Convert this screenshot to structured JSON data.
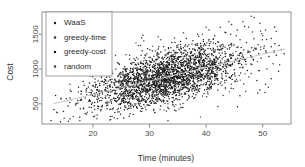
{
  "chart_data": {
    "type": "scatter",
    "title": "",
    "xlabel": "Time (minutes)",
    "ylabel": "Cost",
    "xlim": [
      11,
      55
    ],
    "ylim": [
      210,
      1820
    ],
    "xticks": [
      20,
      30,
      40,
      50
    ],
    "yticks": [
      500,
      1000,
      1500
    ],
    "xtick_labels": [
      "20",
      "30",
      "40",
      "50"
    ],
    "ytick_labels": [
      "500",
      "1000",
      "1500"
    ],
    "grid": false,
    "legend_position": "top-left",
    "marker": "point",
    "marker_color": "#1a1a1a",
    "trend_line": {
      "present": true,
      "color": "#c9c9c9",
      "x_start": 13.0,
      "y_start": 500,
      "x_end": 54.0,
      "y_end": 1290
    },
    "series": [
      {
        "name": "WaaS",
        "color": "#1a1a1a",
        "marker": "point",
        "points": [
          [
            12.6,
            260
          ],
          [
            13.1,
            420
          ],
          [
            13.4,
            620
          ],
          [
            14.8,
            390
          ],
          [
            15.6,
            470
          ],
          [
            16.2,
            560
          ],
          [
            17.1,
            500
          ],
          [
            17.9,
            640
          ],
          [
            18.3,
            430
          ],
          [
            18.8,
            700
          ],
          [
            19.4,
            560
          ],
          [
            19.9,
            620
          ],
          [
            20.3,
            520
          ],
          [
            20.8,
            740
          ],
          [
            21.2,
            650
          ],
          [
            21.7,
            580
          ],
          [
            22.1,
            700
          ],
          [
            22.6,
            630
          ],
          [
            23.0,
            760
          ],
          [
            23.5,
            690
          ],
          [
            24.1,
            640
          ],
          [
            24.6,
            800
          ],
          [
            25.0,
            720
          ],
          [
            25.4,
            660
          ],
          [
            25.9,
            810
          ],
          [
            26.3,
            750
          ],
          [
            26.8,
            700
          ],
          [
            27.2,
            860
          ],
          [
            27.7,
            790
          ],
          [
            28.1,
            730
          ],
          [
            28.6,
            880
          ],
          [
            29.0,
            820
          ],
          [
            29.5,
            760
          ],
          [
            29.9,
            910
          ],
          [
            30.4,
            850
          ],
          [
            30.8,
            790
          ],
          [
            31.3,
            940
          ],
          [
            31.7,
            880
          ],
          [
            32.2,
            820
          ],
          [
            32.6,
            960
          ],
          [
            33.1,
            900
          ],
          [
            33.5,
            840
          ],
          [
            34.0,
            990
          ],
          [
            34.4,
            930
          ],
          [
            34.9,
            870
          ],
          [
            35.3,
            1010
          ],
          [
            35.8,
            950
          ],
          [
            36.2,
            890
          ],
          [
            36.7,
            1040
          ],
          [
            37.1,
            980
          ],
          [
            37.6,
            920
          ],
          [
            38.0,
            1070
          ],
          [
            38.5,
            1010
          ],
          [
            38.9,
            950
          ],
          [
            39.4,
            1100
          ],
          [
            39.8,
            1040
          ],
          [
            40.3,
            980
          ],
          [
            40.7,
            1130
          ],
          [
            41.2,
            1070
          ],
          [
            41.6,
            1010
          ],
          [
            42.1,
            1150
          ],
          [
            42.5,
            1090
          ],
          [
            43.0,
            1030
          ],
          [
            43.4,
            1180
          ],
          [
            43.9,
            1120
          ],
          [
            44.3,
            1060
          ],
          [
            44.8,
            1200
          ],
          [
            45.2,
            1140
          ],
          [
            45.7,
            1080
          ],
          [
            46.1,
            1230
          ],
          [
            46.6,
            1170
          ],
          [
            47.0,
            1110
          ],
          [
            47.5,
            1250
          ],
          [
            47.9,
            1190
          ],
          [
            48.4,
            1130
          ],
          [
            48.8,
            1280
          ],
          [
            49.3,
            1220
          ],
          [
            49.7,
            1160
          ],
          [
            50.2,
            1300
          ],
          [
            50.6,
            1240
          ],
          [
            51.1,
            1180
          ],
          [
            51.5,
            1320
          ],
          [
            52.0,
            1260
          ],
          [
            52.4,
            1200
          ],
          [
            52.9,
            1340
          ],
          [
            53.3,
            1280
          ],
          [
            53.8,
            1220
          ]
        ]
      },
      {
        "name": "greedy-time",
        "color": "#2a2a2a",
        "marker": "point",
        "points": [
          [
            19.5,
            900
          ],
          [
            20.5,
            960
          ],
          [
            21.5,
            880
          ],
          [
            22.5,
            1020
          ],
          [
            23.5,
            940
          ],
          [
            24.5,
            1080
          ],
          [
            25.5,
            1000
          ],
          [
            26.5,
            1140
          ],
          [
            27.5,
            1060
          ],
          [
            28.5,
            1200
          ],
          [
            29.5,
            1120
          ],
          [
            30.5,
            1260
          ],
          [
            31.5,
            1180
          ],
          [
            32.5,
            1320
          ],
          [
            33.5,
            1240
          ],
          [
            34.5,
            1380
          ],
          [
            35.5,
            1300
          ],
          [
            36.5,
            1440
          ],
          [
            37.5,
            1360
          ],
          [
            38.5,
            1500
          ],
          [
            39.5,
            1420
          ],
          [
            40.5,
            1560
          ],
          [
            41.5,
            1480
          ],
          [
            42.5,
            1600
          ],
          [
            43.5,
            1520
          ],
          [
            44.5,
            1640
          ],
          [
            45.5,
            1560
          ],
          [
            46.5,
            1680
          ],
          [
            47.5,
            1600
          ],
          [
            48.5,
            1740
          ],
          [
            49.5,
            1660
          ],
          [
            50.5,
            1560
          ],
          [
            51.5,
            1440
          ]
        ]
      },
      {
        "name": "greedy-cost",
        "color": "#111111",
        "marker": "point",
        "points": [
          [
            21.0,
            460
          ],
          [
            22.5,
            500
          ],
          [
            24.0,
            540
          ],
          [
            25.5,
            580
          ],
          [
            27.0,
            620
          ],
          [
            28.5,
            660
          ],
          [
            30.0,
            700
          ],
          [
            31.5,
            740
          ],
          [
            33.0,
            780
          ],
          [
            34.5,
            820
          ],
          [
            36.0,
            860
          ],
          [
            37.5,
            900
          ],
          [
            39.0,
            940
          ],
          [
            40.5,
            980
          ],
          [
            42.0,
            1020
          ],
          [
            43.5,
            1060
          ],
          [
            45.0,
            1100
          ],
          [
            46.5,
            1140
          ],
          [
            48.0,
            1180
          ],
          [
            49.5,
            700
          ],
          [
            50.5,
            780
          ],
          [
            51.5,
            860
          ]
        ]
      },
      {
        "name": "random",
        "color": "#3a3a3a",
        "marker": "point",
        "points": [
          [
            16.0,
            700
          ],
          [
            18.0,
            560
          ],
          [
            20.0,
            1100
          ],
          [
            22.0,
            820
          ],
          [
            24.0,
            1200
          ],
          [
            26.0,
            900
          ],
          [
            28.0,
            1340
          ],
          [
            30.0,
            1020
          ],
          [
            32.0,
            1420
          ],
          [
            34.0,
            1120
          ],
          [
            36.0,
            1520
          ],
          [
            38.0,
            1220
          ],
          [
            40.0,
            1600
          ],
          [
            42.0,
            1320
          ],
          [
            44.0,
            1680
          ],
          [
            46.0,
            1420
          ],
          [
            48.0,
            1760
          ],
          [
            50.0,
            1480
          ],
          [
            52.0,
            1240
          ],
          [
            53.0,
            1060
          ],
          [
            19.0,
            380
          ],
          [
            23.0,
            420
          ],
          [
            27.0,
            480
          ],
          [
            31.0,
            520
          ],
          [
            35.0,
            560
          ],
          [
            43.0,
            620
          ],
          [
            47.0,
            680
          ],
          [
            51.0,
            740
          ]
        ]
      }
    ],
    "legend": [
      {
        "label": "WaaS",
        "color": "#1a1a1a",
        "marker": "point"
      },
      {
        "label": "greedy-time",
        "color": "#2a2a2a",
        "marker": "point"
      },
      {
        "label": "greedy-cost",
        "color": "#111111",
        "marker": "point"
      },
      {
        "label": "random",
        "color": "#3a3a3a",
        "marker": "point"
      }
    ]
  }
}
